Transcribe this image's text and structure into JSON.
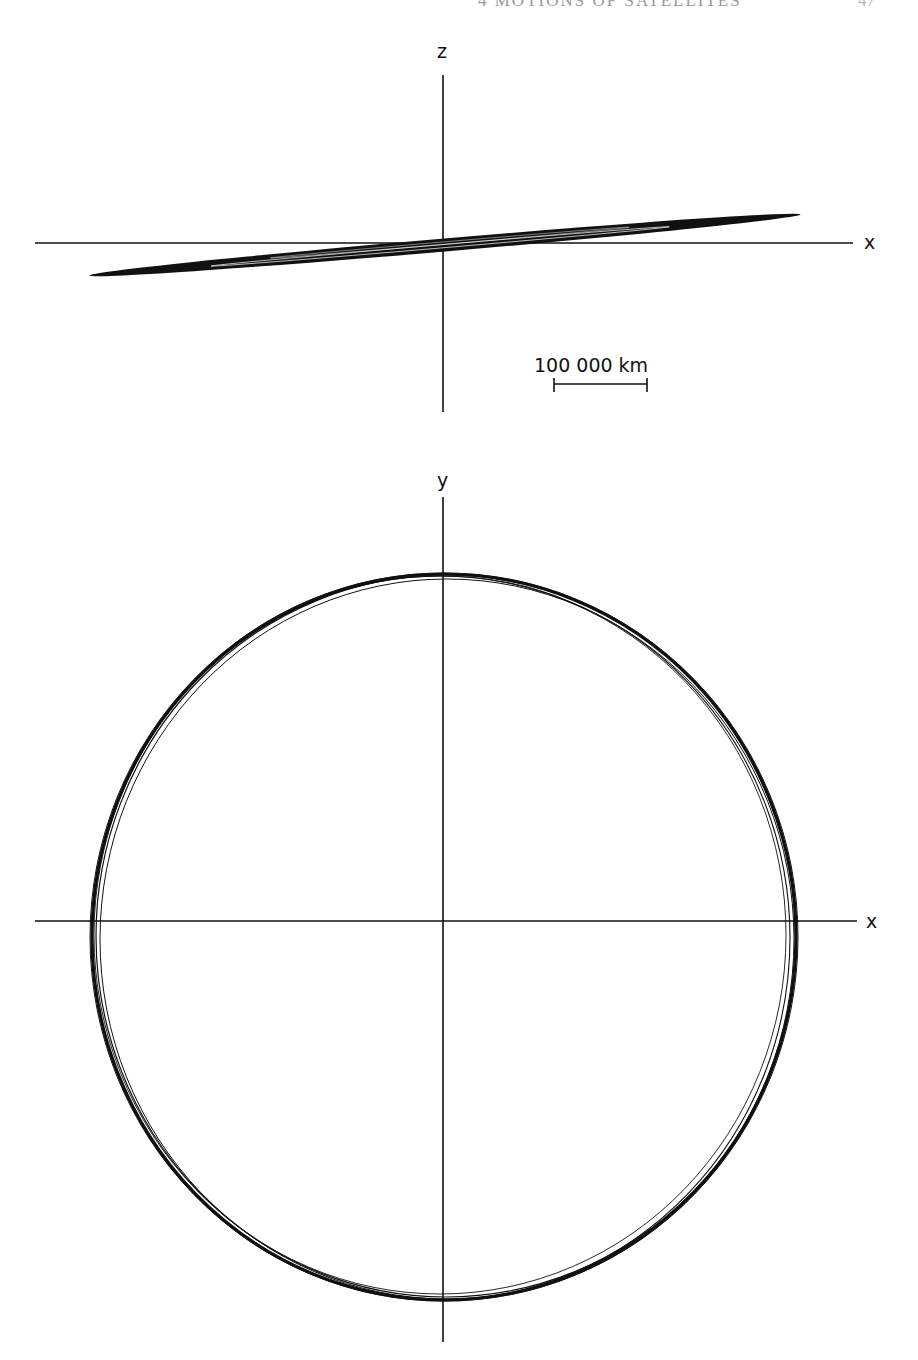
{
  "page": {
    "running_head": "4  MOTIONS OF SATELLITES",
    "page_number": "47"
  },
  "figure_top": {
    "view": "x-z projection",
    "axes": {
      "vertical_label": "z",
      "horizontal_label": "x"
    },
    "scale_bar": {
      "label": "100 000 km",
      "length_km": 100000
    }
  },
  "figure_bottom": {
    "view": "x-y projection",
    "axes": {
      "vertical_label": "y",
      "horizontal_label": "x"
    }
  },
  "colors": {
    "ink": "#111111",
    "paper": "#ffffff"
  }
}
